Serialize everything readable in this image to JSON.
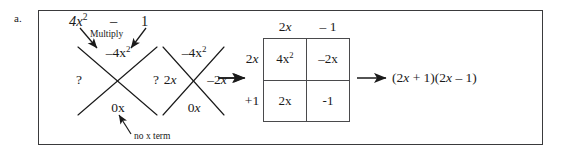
{
  "figure": {
    "item_label": "a.",
    "caption_colors": {
      "ink": "#1a1a1a",
      "box_border": "#3a3a3c",
      "table_border": "#4a4a4c"
    }
  },
  "step1_expression": {
    "term1": "4x",
    "term1_exp": "2",
    "operator": "–",
    "term2": "1",
    "multiply_label": "Multiply"
  },
  "step1_diamond": {
    "name": "x-diagram-unknown-factors",
    "top": "–4x",
    "top_exp": "2",
    "left": "?",
    "right": "?",
    "bottom": "0x",
    "bottom_note": "no x term"
  },
  "step2_diamond": {
    "name": "x-diagram-solved-factors",
    "top": "–4x",
    "top_exp": "2",
    "left": "2x",
    "right": "–2x",
    "bottom": "0x"
  },
  "step3_table": {
    "col_headers": [
      "2x",
      "– 1"
    ],
    "row_headers": [
      "2x",
      "+1"
    ],
    "cells": [
      [
        {
          "base": "4x",
          "exp": "2"
        },
        {
          "base": "–2x",
          "exp": ""
        }
      ],
      [
        {
          "base": "2x",
          "exp": ""
        },
        {
          "base": "-1",
          "exp": ""
        }
      ]
    ]
  },
  "step4_result": {
    "text": "(2x + 1)(2x – 1)"
  },
  "arrows": {
    "arrow1_label": "arrow-step1-to-step2",
    "arrow2_label": "arrow-step2-to-step3",
    "arrow3_label": "arrow-step3-to-result"
  }
}
